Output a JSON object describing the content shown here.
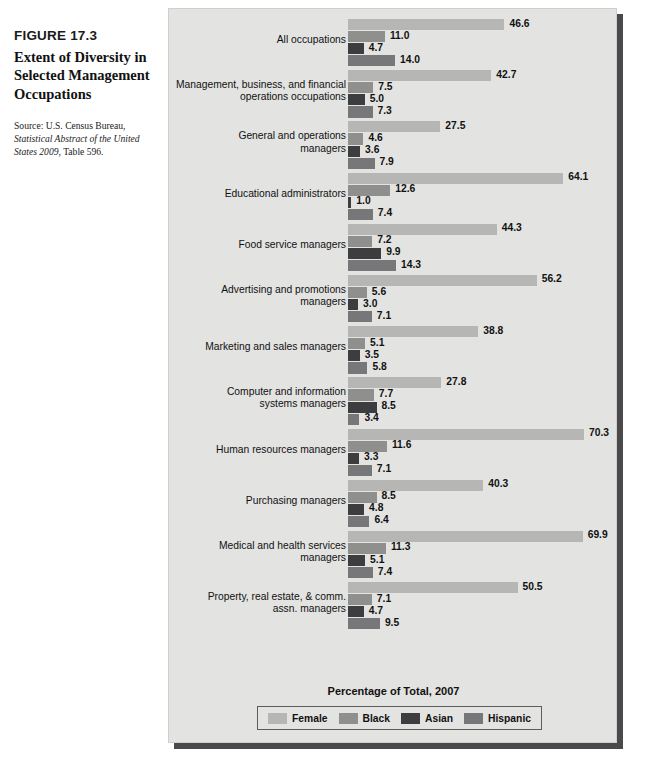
{
  "caption": {
    "figure_number": "FIGURE 17.3",
    "title": "Extent of Diversity in Selected Management Occupations",
    "source_prefix": "Source: U.S. Census Bureau,",
    "source_italic": "Statistical Abstract of the United States 2009",
    "source_suffix": ", Table 596."
  },
  "colors": {
    "female": "#b6b6b4",
    "black": "#8f8f8e",
    "asian": "#3d3d3f",
    "hispanic": "#77777a",
    "panel_background": "#e3e3e1",
    "panel_shadow": "#4a4a4c"
  },
  "chart_data": {
    "type": "bar",
    "orientation": "horizontal",
    "title": "Extent of Diversity in Selected Management Occupations",
    "xlabel": "Percentage of Total, 2007",
    "ylabel": "",
    "xlim": [
      0,
      70.3
    ],
    "grid": false,
    "legend_position": "bottom",
    "value_labels": true,
    "categories": [
      "All occupations",
      "Management, business, and financial operations occupations",
      "General and operations managers",
      "Educational administrators",
      "Food service managers",
      "Advertising and promotions managers",
      "Marketing and sales managers",
      "Computer and information systems managers",
      "Human resources managers",
      "Purchasing managers",
      "Medical and health services managers",
      "Property, real estate, & comm. assn. managers"
    ],
    "series": [
      {
        "name": "Female",
        "values": [
          46.6,
          42.7,
          27.5,
          64.1,
          44.3,
          56.2,
          38.8,
          27.8,
          70.3,
          40.3,
          69.9,
          50.5
        ]
      },
      {
        "name": "Black",
        "values": [
          11.0,
          7.5,
          4.6,
          12.6,
          7.2,
          5.6,
          5.1,
          7.7,
          11.6,
          8.5,
          11.3,
          7.1
        ]
      },
      {
        "name": "Asian",
        "values": [
          4.7,
          5.0,
          3.6,
          1.0,
          9.9,
          3.0,
          3.5,
          8.5,
          3.3,
          4.8,
          5.1,
          4.7
        ]
      },
      {
        "name": "Hispanic",
        "values": [
          14.0,
          7.3,
          7.9,
          7.4,
          14.3,
          7.1,
          5.8,
          3.4,
          7.1,
          6.4,
          7.4,
          9.5
        ]
      }
    ]
  },
  "groups": [
    {
      "label": "All occupations",
      "lines": 1
    },
    {
      "label": "Management, business, and financial\noperations occupations",
      "lines": 2
    },
    {
      "label": "General and operations\nmanagers",
      "lines": 2
    },
    {
      "label": "Educational administrators",
      "lines": 1
    },
    {
      "label": "Food service managers",
      "lines": 1
    },
    {
      "label": "Advertising and promotions\nmanagers",
      "lines": 2
    },
    {
      "label": "Marketing and sales managers",
      "lines": 1
    },
    {
      "label": "Computer and information\nsystems managers",
      "lines": 2
    },
    {
      "label": "Human resources managers",
      "lines": 1
    },
    {
      "label": "Purchasing managers",
      "lines": 1
    },
    {
      "label": "Medical and health services\nmanagers",
      "lines": 2
    },
    {
      "label": "Property, real estate, & comm.\nassn. managers",
      "lines": 2
    }
  ],
  "legend": {
    "items": [
      {
        "label": "Female",
        "color": "#b6b6b4"
      },
      {
        "label": "Black",
        "color": "#8f8f8e"
      },
      {
        "label": "Asian",
        "color": "#3d3d3f"
      },
      {
        "label": "Hispanic",
        "color": "#77777a"
      }
    ]
  }
}
